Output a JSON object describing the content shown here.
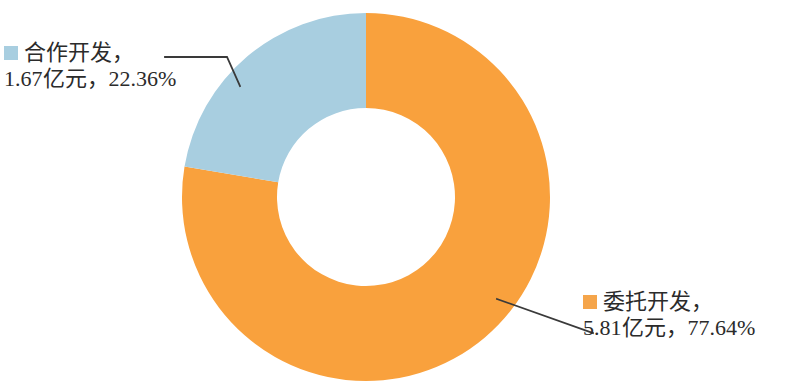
{
  "chart_data": {
    "type": "pie",
    "variant": "donut",
    "title": "",
    "subtitle": "",
    "xlabel": "",
    "ylabel": "",
    "legend_position": "callout-labels",
    "grid": false,
    "unit": "亿元",
    "total_value": 7.48,
    "start_angle_deg": 0,
    "categories": [
      "委托开发",
      "合作开发"
    ],
    "values": [
      5.81,
      1.67
    ],
    "percentages": [
      77.64,
      22.36
    ],
    "colors": [
      "#f9a13d",
      "#a8cee0"
    ],
    "series": [
      {
        "name": "研发投入构成",
        "values": [
          5.81,
          1.67
        ]
      }
    ],
    "slices": [
      {
        "name": "委托开发",
        "value": 5.81,
        "percent": 77.64,
        "color": "#f9a13d",
        "direction": "clockwise-from-top"
      },
      {
        "name": "合作开发",
        "value": 1.67,
        "percent": 22.36,
        "color": "#a8cee0",
        "direction": "counterclockwise-from-top"
      }
    ],
    "annotations": [
      "合作开发，1.67亿元，22.36%",
      "委托开发，5.81亿元，77.64%"
    ]
  },
  "colors": {
    "orange_slice": "#f9a13d",
    "blue_slice": "#a8cee0",
    "orange_swatch": "#f5a54b",
    "blue_swatch": "#a8cee0",
    "leader_line": "#3a3a3a",
    "text": "#2b2b2b",
    "background": "#ffffff"
  },
  "labels": {
    "left": {
      "swatch_icon": "legend-swatch-blue",
      "line1": "合作开发，",
      "line2": "1.67亿元，22.36%",
      "category": "合作开发",
      "value": "1.67亿元",
      "percent": "22.36%"
    },
    "right": {
      "swatch_icon": "legend-swatch-orange",
      "line1": "委托开发，",
      "line2": "5.81亿元，77.64%",
      "category": "委托开发",
      "value": "5.81亿元",
      "percent": "77.64%"
    }
  },
  "geometry": {
    "center_x": 366,
    "center_y": 197,
    "outer_radius": 184,
    "inner_radius": 89
  }
}
